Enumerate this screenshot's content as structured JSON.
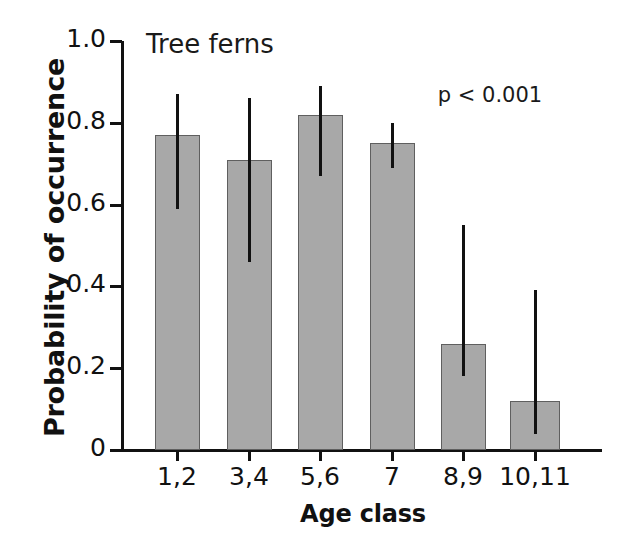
{
  "chart_data": {
    "type": "bar",
    "title": "Tree ferns",
    "xlabel": "Age class",
    "ylabel": "Probability of occurrence",
    "categories": [
      "1,2",
      "3,4",
      "5,6",
      "7",
      "8,9",
      "10,11"
    ],
    "values": [
      0.77,
      0.71,
      0.82,
      0.75,
      0.26,
      0.12
    ],
    "error_low": [
      0.59,
      0.46,
      0.67,
      0.69,
      0.18,
      0.04
    ],
    "error_high": [
      0.87,
      0.86,
      0.89,
      0.8,
      0.55,
      0.39
    ],
    "ylim": [
      0,
      1.0
    ],
    "yticks": [
      0,
      0.2,
      0.4,
      0.6,
      0.8,
      1.0
    ],
    "ytick_labels": [
      "0",
      "0.2",
      "0.4",
      "0.6",
      "0.8",
      "1.0"
    ],
    "grid": false,
    "legend": null,
    "annotations": [
      {
        "text": "p < 0.001",
        "x": 0.78,
        "y": 0.9
      }
    ],
    "bar_color": "#a8a8a8",
    "bar_edge_color": "#5f5f5f",
    "error_color": "#111111",
    "axis_color": "#111111"
  },
  "annotation_pvalue": "p < 0.001"
}
